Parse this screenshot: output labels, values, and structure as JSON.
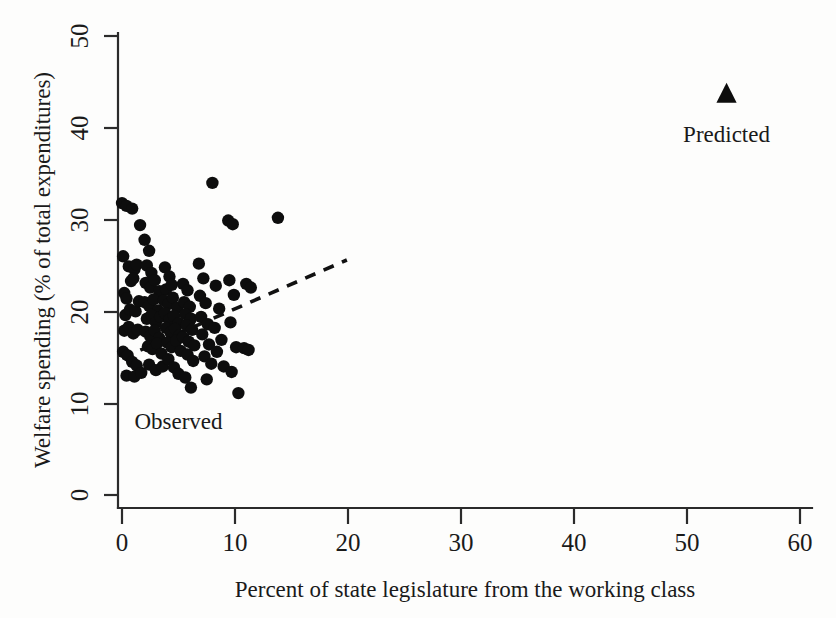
{
  "chart_data": {
    "type": "scatter",
    "title": "",
    "xlabel": "Percent of state legislature from the working class",
    "ylabel": "Welfare spending (% of total expenditures)",
    "xlim": [
      0,
      60
    ],
    "ylim": [
      0,
      50
    ],
    "xticks": [
      0,
      10,
      20,
      30,
      40,
      50,
      60
    ],
    "yticks": [
      0,
      10,
      20,
      30,
      40,
      50
    ],
    "xtick_labels": [
      "0",
      "10",
      "20",
      "30",
      "40",
      "50",
      "60"
    ],
    "ytick_labels": [
      "0",
      "10",
      "20",
      "30",
      "40",
      "50"
    ],
    "grid": false,
    "legend_position": "inline-annotations",
    "annotations": [
      {
        "text": "Predicted",
        "x": 53.5,
        "y": 38.5
      },
      {
        "text": "Observed",
        "x": 5.0,
        "y": 7.2
      }
    ],
    "series": [
      {
        "name": "Observed",
        "marker": "circle",
        "color": "#0d0d0d",
        "points": [
          [
            0.0,
            31.8
          ],
          [
            0.4,
            31.5
          ],
          [
            0.9,
            31.2
          ],
          [
            1.6,
            29.4
          ],
          [
            0.1,
            26.0
          ],
          [
            0.6,
            24.9
          ],
          [
            1.1,
            24.6
          ],
          [
            1.3,
            25.1
          ],
          [
            0.2,
            22.0
          ],
          [
            0.4,
            21.4
          ],
          [
            0.8,
            23.3
          ],
          [
            1.0,
            23.6
          ],
          [
            0.3,
            19.6
          ],
          [
            0.7,
            20.2
          ],
          [
            1.2,
            20.0
          ],
          [
            1.5,
            21.1
          ],
          [
            0.2,
            17.9
          ],
          [
            0.6,
            18.3
          ],
          [
            1.0,
            17.6
          ],
          [
            1.4,
            18.0
          ],
          [
            0.1,
            15.6
          ],
          [
            0.5,
            15.2
          ],
          [
            0.9,
            14.5
          ],
          [
            1.3,
            14.1
          ],
          [
            0.4,
            13.0
          ],
          [
            1.1,
            12.9
          ],
          [
            1.7,
            13.3
          ],
          [
            2.0,
            27.8
          ],
          [
            2.4,
            26.6
          ],
          [
            2.2,
            25.0
          ],
          [
            2.6,
            24.2
          ],
          [
            2.1,
            23.1
          ],
          [
            2.5,
            22.6
          ],
          [
            2.9,
            23.4
          ],
          [
            3.3,
            22.2
          ],
          [
            2.0,
            21.0
          ],
          [
            2.4,
            20.6
          ],
          [
            2.8,
            21.3
          ],
          [
            3.2,
            20.1
          ],
          [
            2.2,
            19.2
          ],
          [
            2.6,
            19.6
          ],
          [
            3.0,
            18.8
          ],
          [
            3.4,
            19.4
          ],
          [
            2.1,
            17.8
          ],
          [
            2.5,
            17.3
          ],
          [
            2.9,
            17.9
          ],
          [
            3.3,
            17.1
          ],
          [
            2.3,
            16.2
          ],
          [
            2.7,
            15.9
          ],
          [
            3.1,
            16.5
          ],
          [
            3.5,
            15.4
          ],
          [
            2.4,
            14.2
          ],
          [
            3.0,
            13.6
          ],
          [
            3.6,
            14.0
          ],
          [
            3.8,
            24.8
          ],
          [
            4.2,
            23.8
          ],
          [
            3.9,
            22.4
          ],
          [
            4.4,
            22.9
          ],
          [
            3.7,
            21.2
          ],
          [
            4.1,
            20.8
          ],
          [
            4.5,
            21.5
          ],
          [
            4.9,
            20.4
          ],
          [
            3.8,
            19.8
          ],
          [
            4.2,
            19.1
          ],
          [
            4.6,
            19.5
          ],
          [
            5.0,
            18.7
          ],
          [
            3.9,
            18.2
          ],
          [
            4.3,
            17.7
          ],
          [
            4.7,
            18.1
          ],
          [
            5.1,
            17.4
          ],
          [
            4.0,
            16.6
          ],
          [
            4.4,
            16.1
          ],
          [
            4.8,
            16.8
          ],
          [
            5.2,
            15.7
          ],
          [
            4.1,
            14.8
          ],
          [
            4.6,
            13.9
          ],
          [
            5.0,
            13.2
          ],
          [
            5.4,
            23.0
          ],
          [
            5.8,
            22.3
          ],
          [
            5.5,
            21.0
          ],
          [
            6.0,
            20.5
          ],
          [
            5.6,
            19.7
          ],
          [
            6.1,
            19.2
          ],
          [
            5.7,
            18.5
          ],
          [
            6.2,
            18.0
          ],
          [
            5.4,
            17.2
          ],
          [
            5.9,
            16.7
          ],
          [
            6.4,
            16.3
          ],
          [
            5.8,
            15.3
          ],
          [
            6.3,
            14.6
          ],
          [
            5.6,
            12.8
          ],
          [
            6.1,
            11.7
          ],
          [
            6.8,
            25.2
          ],
          [
            7.2,
            23.6
          ],
          [
            6.9,
            21.7
          ],
          [
            7.4,
            20.9
          ],
          [
            7.0,
            19.4
          ],
          [
            7.6,
            18.6
          ],
          [
            7.1,
            17.5
          ],
          [
            7.7,
            16.4
          ],
          [
            7.3,
            15.1
          ],
          [
            7.9,
            14.3
          ],
          [
            7.5,
            12.6
          ],
          [
            8.0,
            34.0
          ],
          [
            8.3,
            22.8
          ],
          [
            8.6,
            20.3
          ],
          [
            8.2,
            18.2
          ],
          [
            8.8,
            16.9
          ],
          [
            8.4,
            15.6
          ],
          [
            9.0,
            14.0
          ],
          [
            9.4,
            29.9
          ],
          [
            9.8,
            29.5
          ],
          [
            9.5,
            23.4
          ],
          [
            9.9,
            21.8
          ],
          [
            9.6,
            18.8
          ],
          [
            10.1,
            16.1
          ],
          [
            9.7,
            13.4
          ],
          [
            10.3,
            11.1
          ],
          [
            10.8,
            16.0
          ],
          [
            11.2,
            15.8
          ],
          [
            11.0,
            23.0
          ],
          [
            11.4,
            22.6
          ],
          [
            13.8,
            30.2
          ]
        ]
      },
      {
        "name": "Predicted",
        "marker": "triangle",
        "color": "#0d0d0d",
        "points": [
          [
            53.5,
            43.7
          ]
        ]
      }
    ],
    "trend_line": {
      "name": "fitted regression line",
      "style": "dashed",
      "color": "#111111",
      "x_start": 0.0,
      "y_start": 14.9,
      "x_end": 19.9,
      "y_end": 25.6
    }
  }
}
